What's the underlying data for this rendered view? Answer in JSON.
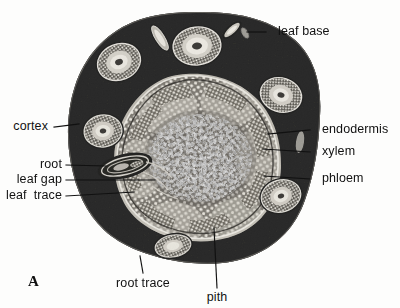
{
  "figure": {
    "panel_label": "A",
    "background_color": "#fdfdfc",
    "specimen_color": "#0a0a0a",
    "stele_color": "#b9b5ac",
    "bundle_color": "#e9e6de"
  },
  "labels": [
    {
      "id": "leaf-base",
      "text": "leaf base",
      "align": "left",
      "x": 278,
      "y": 32,
      "leader": {
        "x1": 266,
        "y1": 32,
        "x2": 247,
        "y2": 32
      }
    },
    {
      "id": "cortex",
      "text": "cortex",
      "align": "right",
      "x": 48,
      "y": 127,
      "leader": {
        "x1": 54,
        "y1": 127,
        "x2": 79,
        "y2": 124
      }
    },
    {
      "id": "endodermis",
      "text": "endodermis",
      "align": "left",
      "x": 322,
      "y": 130,
      "leader": {
        "x1": 310,
        "y1": 130,
        "x2": 268,
        "y2": 134
      }
    },
    {
      "id": "xylem",
      "text": "xylem",
      "align": "left",
      "x": 322,
      "y": 152,
      "leader": {
        "x1": 310,
        "y1": 152,
        "x2": 263,
        "y2": 149
      }
    },
    {
      "id": "root",
      "text": "root",
      "align": "right",
      "x": 62,
      "y": 165,
      "leader": {
        "x1": 66,
        "y1": 165,
        "x2": 106,
        "y2": 166
      }
    },
    {
      "id": "leaf-gap",
      "text": "leaf gap",
      "align": "right",
      "x": 62,
      "y": 180,
      "leader": {
        "x1": 66,
        "y1": 180,
        "x2": 155,
        "y2": 180
      }
    },
    {
      "id": "phloem",
      "text": "phloem",
      "align": "left",
      "x": 322,
      "y": 179,
      "leader": {
        "x1": 310,
        "y1": 179,
        "x2": 264,
        "y2": 176
      }
    },
    {
      "id": "leaf-trace",
      "text": "leaf  trace",
      "align": "right",
      "x": 62,
      "y": 196,
      "leader": {
        "x1": 66,
        "y1": 196,
        "x2": 134,
        "y2": 192
      }
    },
    {
      "id": "root-trace",
      "text": "root trace",
      "align": "center",
      "x": 143,
      "y": 284,
      "leader": {
        "x1": 143,
        "y1": 273,
        "x2": 140,
        "y2": 256
      }
    },
    {
      "id": "pith",
      "text": "pith",
      "align": "center",
      "x": 217,
      "y": 298,
      "leader": {
        "x1": 217,
        "y1": 288,
        "x2": 214,
        "y2": 228
      }
    }
  ],
  "structures": {
    "outline": "irregular rounded stem section",
    "cortex": "dark ground tissue",
    "stele": "central vascular cylinder",
    "pith": "central dark parenchyma",
    "leaf_bases": 7,
    "root_traces": 2
  }
}
